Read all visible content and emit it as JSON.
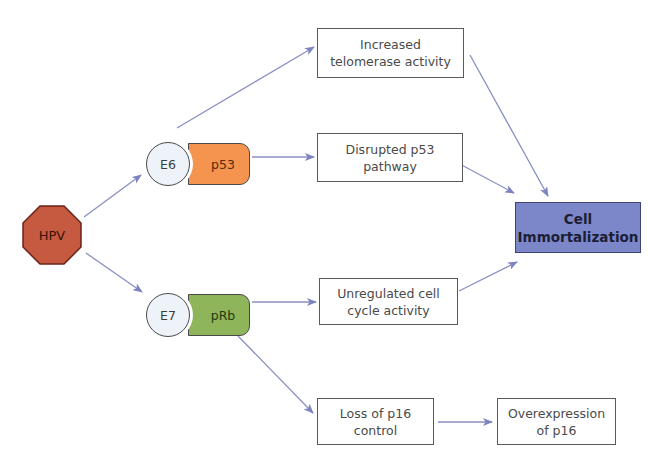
{
  "diagram": {
    "type": "flow diagram",
    "nodes": {
      "hpv": {
        "label": "HPV",
        "shape": "octagon",
        "fill": "#c65a40"
      },
      "e6": {
        "label": "E6",
        "shape": "circle",
        "fill": "#edf3f8"
      },
      "p53": {
        "label": "p53",
        "shape": "pill",
        "fill": "#f4944e"
      },
      "e7": {
        "label": "E7",
        "shape": "circle",
        "fill": "#edf3f8"
      },
      "prb": {
        "label": "pRb",
        "shape": "pill",
        "fill": "#8fb55a"
      },
      "telomerase": {
        "line1": "Increased",
        "line2": "telomerase activity"
      },
      "p53_pathway": {
        "line1": "Disrupted p53",
        "line2": "pathway"
      },
      "cell_cycle": {
        "line1": "Unregulated cell",
        "line2": "cycle activity"
      },
      "p16_loss": {
        "line1": "Loss of p16",
        "line2": "control"
      },
      "p16_over": {
        "line1": "Overexpression",
        "line2": "of p16"
      },
      "immortalization": {
        "line1": "Cell",
        "line2": "Immortalization",
        "fill": "#7c87c9"
      }
    },
    "edges": [
      {
        "from": "HPV",
        "to": "E6"
      },
      {
        "from": "HPV",
        "to": "E7"
      },
      {
        "from": "E6",
        "to": "Increased telomerase activity"
      },
      {
        "from": "p53",
        "to": "Disrupted p53 pathway"
      },
      {
        "from": "pRb",
        "to": "Unregulated cell cycle activity"
      },
      {
        "from": "pRb",
        "to": "Loss of p16 control"
      },
      {
        "from": "Loss of p16 control",
        "to": "Overexpression of p16"
      },
      {
        "from": "Increased telomerase activity",
        "to": "Cell Immortalization"
      },
      {
        "from": "Disrupted p53 pathway",
        "to": "Cell Immortalization"
      },
      {
        "from": "Unregulated cell cycle activity",
        "to": "Cell Immortalization"
      }
    ],
    "edge_color": "#8a8fc4"
  }
}
